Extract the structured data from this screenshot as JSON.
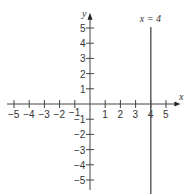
{
  "chart_data": {
    "type": "line",
    "title": "",
    "xlabel": "x",
    "ylabel": "y",
    "xlim": [
      -5,
      5
    ],
    "ylim": [
      -5,
      5
    ],
    "x_ticks": [
      -5,
      -4,
      -3,
      -2,
      -1,
      1,
      2,
      3,
      4,
      5
    ],
    "y_ticks": [
      -5,
      -4,
      -3,
      -2,
      -1,
      1,
      2,
      3,
      4,
      5
    ],
    "x_tick_labels": [
      "−5",
      "−4",
      "−3",
      "−2",
      "−1",
      "1",
      "2",
      "3",
      "4",
      "5"
    ],
    "y_tick_labels": [
      "−5",
      "−4",
      "−3",
      "−2",
      "−1",
      "1",
      "2",
      "3",
      "4",
      "5"
    ],
    "grid": false,
    "series": [
      {
        "name": "x = 4",
        "type": "vertical-line",
        "x": 4,
        "y_range": [
          -5.6,
          5
        ]
      }
    ],
    "annotations": [
      {
        "text": "x = 4",
        "x": 4,
        "y": 5.5
      }
    ]
  },
  "labels": {
    "x_axis": "x",
    "y_axis": "y",
    "line_label": "x = 4"
  },
  "colors": {
    "axis": "#444444",
    "line": "#555555"
  }
}
